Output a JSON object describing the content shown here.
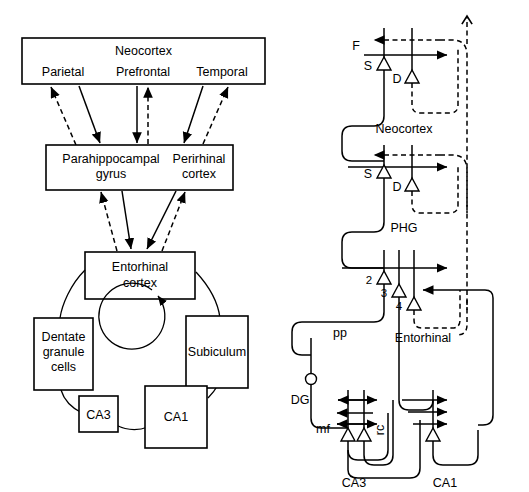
{
  "figure": {
    "panels": [
      {
        "id": "left",
        "name": "anatomical-connectivity-diagram",
        "boxes": [
          {
            "id": "neocortex",
            "label": "Neocortex",
            "sub": [
              "Parietal",
              "Prefrontal",
              "Temporal"
            ]
          },
          {
            "id": "phg",
            "label": "Parahippocampal gyrus"
          },
          {
            "id": "perirhinal",
            "label": "Perirhinal cortex"
          },
          {
            "id": "entorhinal",
            "label": "Entorhinal cortex"
          },
          {
            "id": "dentate",
            "label": "Dentate granule cells"
          },
          {
            "id": "subiculum",
            "label": "Subiculum"
          },
          {
            "id": "ca3",
            "label": "CA3"
          },
          {
            "id": "ca1",
            "label": "CA1"
          }
        ]
      },
      {
        "id": "right",
        "name": "computational-circuit-diagram",
        "labels": [
          {
            "id": "f",
            "text": "F"
          },
          {
            "id": "s1",
            "text": "S"
          },
          {
            "id": "d1",
            "text": "D"
          },
          {
            "id": "neocortex",
            "text": "Neocortex"
          },
          {
            "id": "s2",
            "text": "S"
          },
          {
            "id": "d2",
            "text": "D"
          },
          {
            "id": "phg",
            "text": "PHG"
          },
          {
            "id": "layer2",
            "text": "2"
          },
          {
            "id": "layer3",
            "text": "3"
          },
          {
            "id": "layer4",
            "text": "4"
          },
          {
            "id": "pp",
            "text": "pp"
          },
          {
            "id": "entorhinal",
            "text": "Entorhinal"
          },
          {
            "id": "dg",
            "text": "DG"
          },
          {
            "id": "mf",
            "text": "mf"
          },
          {
            "id": "rc",
            "text": "rc"
          },
          {
            "id": "ca3",
            "text": "CA3"
          },
          {
            "id": "ca1",
            "text": "CA1"
          }
        ]
      }
    ]
  },
  "left_panel": {
    "neocortex": {
      "title": "Neocortex",
      "parietal": "Parietal",
      "prefrontal": "Prefrontal",
      "temporal": "Temporal"
    },
    "parahippocampal": {
      "line1": "Parahippocampal",
      "line2": "gyrus"
    },
    "perirhinal": {
      "line1": "Perirhinal",
      "line2": "cortex"
    },
    "entorhinal": {
      "line1": "Entorhinal",
      "line2": "cortex"
    },
    "dentate": {
      "line1": "Dentate",
      "line2": "granule",
      "line3": "cells"
    },
    "subiculum": {
      "label": "Subiculum"
    },
    "ca3": {
      "label": "CA3"
    },
    "ca1": {
      "label": "CA1"
    }
  },
  "right_panel": {
    "f_label": "F",
    "s_label_top": "S",
    "d_label_top": "D",
    "neocortex_label": "Neocortex",
    "s_label_mid": "S",
    "d_label_mid": "D",
    "phg_label": "PHG",
    "layer2_label": "2",
    "layer3_label": "3",
    "layer4_label": "4",
    "pp_label": "pp",
    "entorhinal_label": "Entorhinal",
    "dg_label": "DG",
    "mf_label": "mf",
    "rc_label": "rc",
    "ca3_label": "CA3",
    "ca1_label": "CA1"
  },
  "colors": {
    "stroke": "#000000",
    "background": "#ffffff"
  }
}
